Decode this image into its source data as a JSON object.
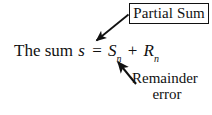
{
  "diagram": {
    "background_color": "#ffffff",
    "ink_color": "#111111",
    "callout_box": {
      "label": "Partial Sum",
      "border_color": "#111111"
    },
    "equation": {
      "lead_text": "The sum",
      "subject": "s",
      "equals": "=",
      "term_partial_base": "S",
      "term_partial_sub": "n",
      "plus": "+",
      "term_remainder_base": "R",
      "term_remainder_sub": "n",
      "plain": "The sum s = S_n + R_n"
    },
    "remainder_label": {
      "line1": "Remainder",
      "line2": "error"
    },
    "arrows": [
      {
        "name": "partial-sum-arrow",
        "from": "Partial Sum box",
        "to": "S_n term",
        "color": "#111111"
      },
      {
        "name": "remainder-arrow",
        "from": "Remainder error label",
        "to": "R_n term",
        "color": "#111111"
      }
    ]
  }
}
